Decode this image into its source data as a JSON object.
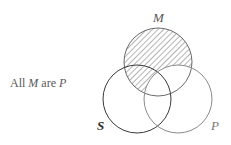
{
  "caption": {
    "prefix": "All ",
    "subject": "M",
    "copula": " are ",
    "predicate": "P"
  },
  "diagram": {
    "type": "venn",
    "sets": [
      {
        "id": "M",
        "label": "M",
        "stroke": "#6a6a6a"
      },
      {
        "id": "S",
        "label": "S",
        "stroke": "#3a3a3a"
      },
      {
        "id": "P",
        "label": "P",
        "stroke": "#8a8a8a"
      }
    ],
    "shaded_region": "M outside P",
    "hatch_color": "#6a6a6a"
  }
}
